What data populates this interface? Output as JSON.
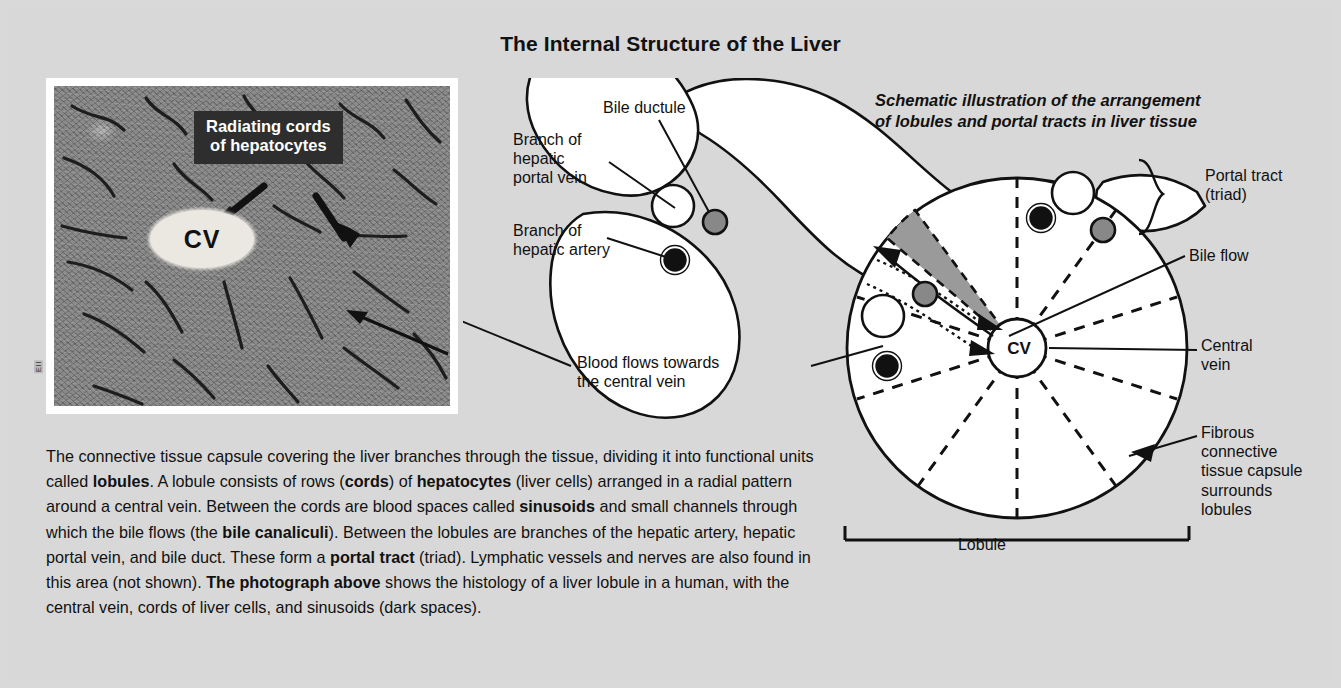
{
  "title": "The Internal Structure of the Liver",
  "schematic": {
    "heading": "Schematic illustration of the arrangement\nof lobules and portal tracts in liver tissue",
    "labels": {
      "bile_ductule": "Bile ductule",
      "hepatic_portal_vein": "Branch of\nhepatic\nportal vein",
      "hepatic_artery": "Branch of\nhepatic artery",
      "portal_tract": "Portal tract\n(triad)",
      "bile_flow": "Bile flow",
      "central_vein": "Central\nvein",
      "fibrous_capsule": "Fibrous\nconnective\ntissue capsule\nsurrounds\nlobules",
      "blood_flow": "Blood flows towards\nthe central vein",
      "lobule": "Lobule",
      "central_vein_abbr": "CV"
    }
  },
  "micrograph": {
    "callout": "Radiating cords\nof hepatocytes",
    "central_vein_abbr": "CV",
    "credit": "EII"
  },
  "body": {
    "segments": [
      {
        "text": "The connective tissue capsule covering the liver branches through the tissue, dividing it into functional units called ",
        "bold": false
      },
      {
        "text": "lobules",
        "bold": true
      },
      {
        "text": ". A lobule consists of rows (",
        "bold": false
      },
      {
        "text": "cords",
        "bold": true
      },
      {
        "text": ") of ",
        "bold": false
      },
      {
        "text": "hepatocytes",
        "bold": true
      },
      {
        "text": " (liver cells) arranged in a radial pattern around a central vein. Between the cords are blood spaces called ",
        "bold": false
      },
      {
        "text": "sinusoids",
        "bold": true
      },
      {
        "text": " and small channels through which the bile flows (the ",
        "bold": false
      },
      {
        "text": "bile canaliculi",
        "bold": true
      },
      {
        "text": "). Between the lobules are branches of the hepatic artery, hepatic portal vein, and bile duct. These form a ",
        "bold": false
      },
      {
        "text": "portal tract",
        "bold": true
      },
      {
        "text": " (triad). Lymphatic vessels and nerves are also found in this area (not shown). ",
        "bold": false
      },
      {
        "text": "The photograph above",
        "bold": true
      },
      {
        "text": " shows the histology of a liver lobule in a human, with the central vein, cords of liver cells, and sinusoids (dark spaces).",
        "bold": false
      }
    ]
  },
  "colors": {
    "background": "#d8d8d8",
    "ink": "#111111",
    "lobule_fill": "#ffffff",
    "wedge_fill": "#9a9a9a",
    "callout_bg": "#2e2e2e",
    "bile_ductule": "#777777",
    "hepatic_artery": "#111111"
  }
}
